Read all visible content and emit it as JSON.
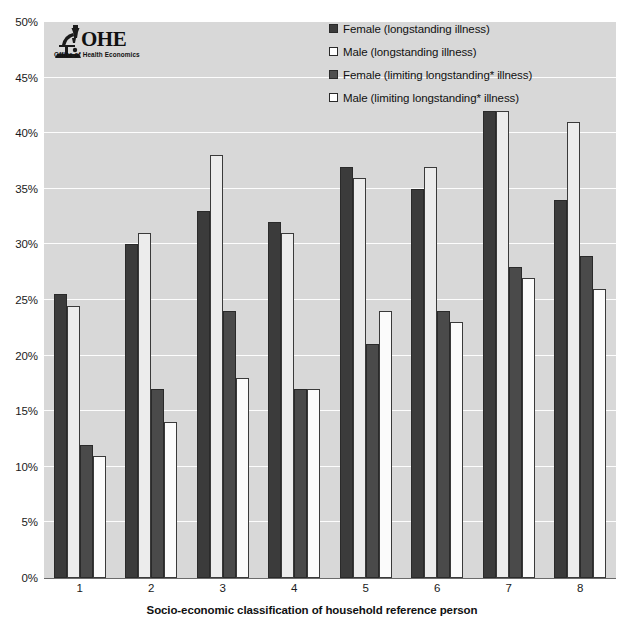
{
  "chart_data": {
    "type": "bar",
    "title": "",
    "xlabel": "Socio-economic classification of household reference person",
    "ylabel": "",
    "categories": [
      "1",
      "2",
      "3",
      "4",
      "5",
      "6",
      "7",
      "8"
    ],
    "ylim": [
      0,
      50
    ],
    "ytick_labels": [
      "0%",
      "5%",
      "10%",
      "15%",
      "20%",
      "25%",
      "30%",
      "35%",
      "40%",
      "45%",
      "50%"
    ],
    "ytick_values": [
      0,
      5,
      10,
      15,
      20,
      25,
      30,
      35,
      40,
      45,
      50
    ],
    "grid": true,
    "legend_position": "top-right",
    "series": [
      {
        "name": "Female (longstanding illness)",
        "color": "#3b3b3b",
        "values": [
          25.5,
          30,
          33,
          32,
          37,
          35,
          42,
          34
        ]
      },
      {
        "name": "Male (longstanding illness)",
        "color": "#ececec",
        "values": [
          24.5,
          31,
          38,
          31,
          36,
          37,
          42,
          41
        ]
      },
      {
        "name": "Female (limiting longstanding* illness)",
        "color": "#4a4a4a",
        "values": [
          12,
          17,
          24,
          17,
          21,
          24,
          28,
          29
        ]
      },
      {
        "name": "Male (limiting longstanding* illness)",
        "color": "#fbfbfb",
        "values": [
          11,
          14,
          18,
          17,
          24,
          23,
          27,
          26
        ]
      }
    ]
  },
  "legend": {
    "items": [
      {
        "label": "Female (longstanding illness)"
      },
      {
        "label": "Male (longstanding illness)"
      },
      {
        "label": "Female (limiting longstanding* illness)"
      },
      {
        "label": "Male (limiting longstanding* illness)"
      }
    ]
  },
  "logo": {
    "acronym": "OHE",
    "subtitle": "Office of Health Economics"
  },
  "axis": {
    "x_title": "Socio-economic classification of household reference person"
  }
}
